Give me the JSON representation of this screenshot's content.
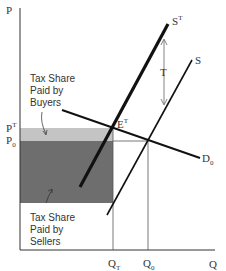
{
  "axes": {
    "y_label": "P",
    "x_label": "Q"
  },
  "price_labels": {
    "pt_base": "P",
    "pt_sup": "T",
    "p0_base": "P",
    "p0_sub": "0"
  },
  "quantity_labels": {
    "qt_base": "Q",
    "qt_sub": "T",
    "q0_base": "Q",
    "q0_sub": "0"
  },
  "curves": {
    "st_base": "S",
    "st_sup": "T",
    "s": "S",
    "d_base": "D",
    "d_sub": "0",
    "et_base": "E",
    "et_sup": "T",
    "tax": "T"
  },
  "annotations": {
    "buyers": [
      "Tax Share",
      "Paid by",
      "Buyers"
    ],
    "sellers": [
      "Tax Share",
      "Paid by",
      "Sellers"
    ]
  },
  "colors": {
    "buyers_area": "#c4c4c4",
    "sellers_area": "#6e6e6e",
    "line": "#111111"
  }
}
